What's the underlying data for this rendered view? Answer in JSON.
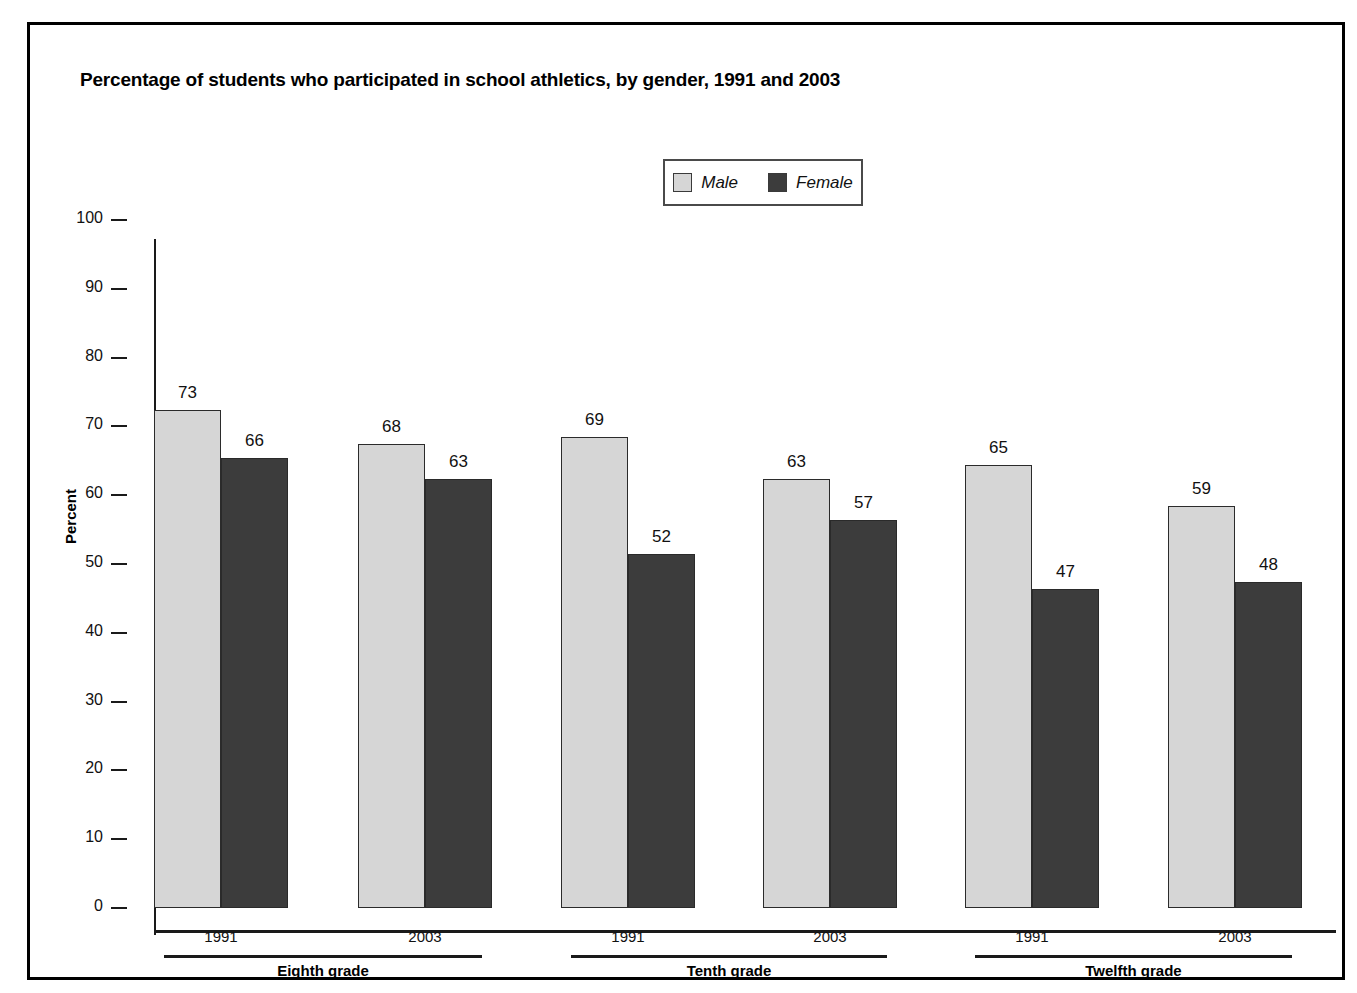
{
  "chart_data": {
    "type": "bar",
    "title": "Percentage of students who participated in school athletics, by gender, 1991 and 2003",
    "xlabel": "",
    "ylabel": "Percent",
    "ylim": [
      0,
      100
    ],
    "ytick_step": 10,
    "yticks": [
      100,
      90,
      80,
      70,
      60,
      50,
      40,
      30,
      20,
      10,
      0
    ],
    "grid": false,
    "legend_position": "top-center",
    "legend": [
      {
        "name": "Male",
        "color": "#d6d6d6"
      },
      {
        "name": "Female",
        "color": "#3c3c3c"
      }
    ],
    "groups": [
      "Eighth grade",
      "Tenth grade",
      "Twelfth grade"
    ],
    "categories": [
      "1991",
      "2003",
      "1991",
      "2003",
      "1991",
      "2003"
    ],
    "category_groups": [
      "Eighth grade",
      "Eighth grade",
      "Tenth grade",
      "Tenth grade",
      "Twelfth grade",
      "Twelfth grade"
    ],
    "series": [
      {
        "name": "Male",
        "values": [
          73,
          68,
          69,
          63,
          65,
          59
        ]
      },
      {
        "name": "Female",
        "values": [
          66,
          63,
          57,
          52,
          47,
          48
        ]
      }
    ],
    "bars": [
      {
        "group": "Eighth grade",
        "year": "1991",
        "gender": "Male",
        "value": 73
      },
      {
        "group": "Eighth grade",
        "year": "1991",
        "gender": "Female",
        "value": 66
      },
      {
        "group": "Eighth grade",
        "year": "2003",
        "gender": "Male",
        "value": 68
      },
      {
        "group": "Eighth grade",
        "year": "2003",
        "gender": "Female",
        "value": 63
      },
      {
        "group": "Tenth grade",
        "year": "1991",
        "gender": "Male",
        "value": 69
      },
      {
        "group": "Tenth grade",
        "year": "1991",
        "gender": "Female",
        "value": 52
      },
      {
        "group": "Tenth grade",
        "year": "2003",
        "gender": "Male",
        "value": 63
      },
      {
        "group": "Tenth grade",
        "year": "2003",
        "gender": "Female",
        "value": 57
      },
      {
        "group": "Twelfth grade",
        "year": "1991",
        "gender": "Male",
        "value": 65
      },
      {
        "group": "Twelfth grade",
        "year": "1991",
        "gender": "Female",
        "value": 47
      },
      {
        "group": "Twelfth grade",
        "year": "2003",
        "gender": "Male",
        "value": 59
      },
      {
        "group": "Twelfth grade",
        "year": "2003",
        "gender": "Female",
        "value": 48
      }
    ]
  },
  "colors": {
    "male": "#d6d6d6",
    "female": "#3c3c3c",
    "axis": "#1a1a1a",
    "text": "#111111",
    "frame": "#000000"
  }
}
